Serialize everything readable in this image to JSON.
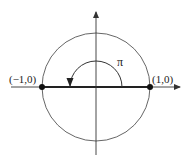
{
  "diagram": {
    "colors": {
      "line": "#333333",
      "background": "#ffffff"
    },
    "center": [
      96,
      87
    ],
    "circle_radius": 54,
    "arc_radius": 26,
    "labels": {
      "left_point": "(−1,0)",
      "right_point": "(1,0)",
      "angle": "π"
    },
    "points": [
      {
        "name": "left-point",
        "coords": "(-1,0)"
      },
      {
        "name": "right-point",
        "coords": "(1,0)"
      }
    ]
  }
}
